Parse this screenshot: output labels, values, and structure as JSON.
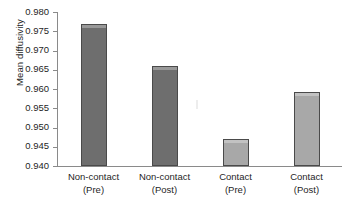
{
  "chart_data": {
    "type": "bar",
    "title": "",
    "xlabel": "",
    "ylabel": "Mean diffusivity",
    "categories": [
      "Non-contact (Pre)",
      "Non-contact (Post)",
      "Contact (Pre)",
      "Contact (Post)"
    ],
    "category_lines": [
      {
        "line1": "Non-contact",
        "line2": "(Pre)"
      },
      {
        "line1": "Non-contact",
        "line2": "(Post)"
      },
      {
        "line1": "Contact",
        "line2": "(Pre)"
      },
      {
        "line1": "Contact",
        "line2": "(Post)"
      }
    ],
    "values": [
      0.9768,
      0.966,
      0.9471,
      0.9592
    ],
    "bar_colors": [
      "#6e6e6e",
      "#6e6e6e",
      "#a8a8a8",
      "#a8a8a8"
    ],
    "ylim": [
      0.94,
      0.98
    ],
    "ytick_step": 0.005,
    "ytick_labels": [
      "0.980",
      "0.975",
      "0.970",
      "0.965",
      "0.960",
      "0.955",
      "0.950",
      "0.945",
      "0.940"
    ],
    "ytick_values": [
      0.98,
      0.975,
      0.97,
      0.965,
      0.96,
      0.955,
      0.95,
      0.945,
      0.94
    ],
    "grid": false,
    "legend": "none",
    "axis_color": "#8a8a8a",
    "bar_border_color": "#4a4a4a"
  }
}
